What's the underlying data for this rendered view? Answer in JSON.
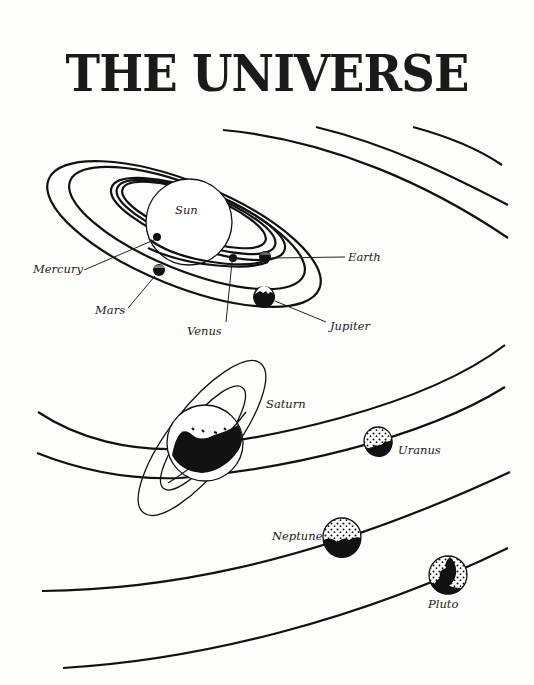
{
  "title": "THE UNIVERSE",
  "labels": {
    "sun": "Sun",
    "mercury": "Mercury",
    "venus": "Venus",
    "earth": "Earth",
    "mars": "Mars",
    "jupiter": "Jupiter",
    "saturn": "Saturn",
    "uranus": "Uranus",
    "neptune": "Neptune",
    "pluto": "Pluto"
  },
  "colors": {
    "ink": "#111111",
    "paper": "#fdfdfc"
  }
}
